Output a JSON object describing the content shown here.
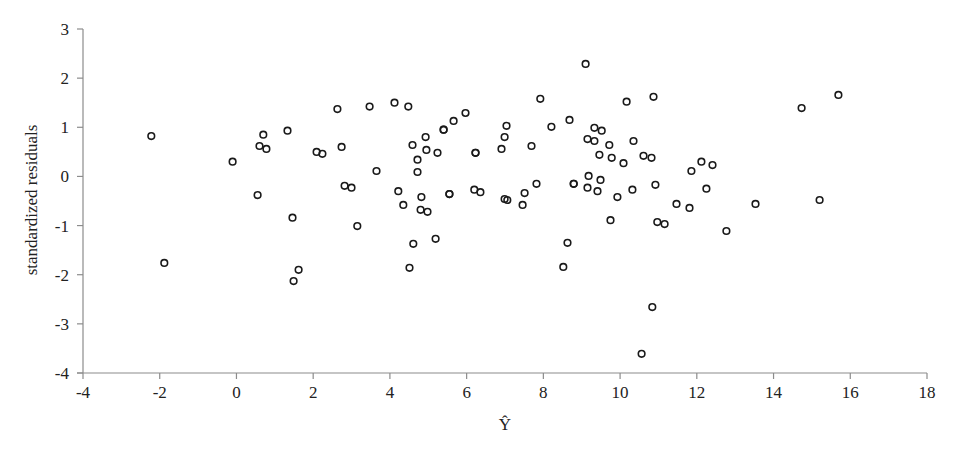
{
  "chart_data": {
    "type": "scatter",
    "title": "",
    "xlabel": "Ŷ",
    "ylabel": "standardized residuals",
    "xlim": [
      -4,
      18
    ],
    "ylim": [
      -4,
      3
    ],
    "xticks": [
      -4,
      -2,
      0,
      2,
      4,
      6,
      8,
      10,
      12,
      14,
      16,
      18
    ],
    "yticks": [
      -4,
      -3,
      -2,
      -1,
      0,
      1,
      2,
      3
    ],
    "grid": false,
    "legend": null,
    "marker": "open-circle",
    "colors": {
      "marker": "#1a1a1a",
      "axis": "#8c8c8c",
      "text": "#222222"
    },
    "series": [
      {
        "name": "residuals",
        "points": [
          [
            -2.22,
            0.82
          ],
          [
            -1.88,
            -1.76
          ],
          [
            -0.1,
            0.3
          ],
          [
            0.7,
            0.85
          ],
          [
            0.6,
            0.62
          ],
          [
            0.78,
            0.56
          ],
          [
            1.33,
            0.93
          ],
          [
            0.55,
            -0.38
          ],
          [
            1.46,
            -0.84
          ],
          [
            1.62,
            -1.9
          ],
          [
            1.49,
            -2.13
          ],
          [
            2.09,
            0.5
          ],
          [
            2.24,
            0.46
          ],
          [
            2.63,
            1.37
          ],
          [
            2.74,
            0.6
          ],
          [
            2.82,
            -0.19
          ],
          [
            3.0,
            -0.23
          ],
          [
            3.15,
            -1.01
          ],
          [
            3.47,
            1.42
          ],
          [
            3.65,
            0.11
          ],
          [
            4.12,
            1.5
          ],
          [
            4.48,
            1.42
          ],
          [
            4.22,
            -0.3
          ],
          [
            4.35,
            -0.58
          ],
          [
            4.61,
            -1.37
          ],
          [
            4.51,
            -1.86
          ],
          [
            4.59,
            0.64
          ],
          [
            4.93,
            0.8
          ],
          [
            4.95,
            0.54
          ],
          [
            4.72,
            0.34
          ],
          [
            4.72,
            0.09
          ],
          [
            4.82,
            -0.42
          ],
          [
            4.8,
            -0.68
          ],
          [
            4.98,
            -0.72
          ],
          [
            5.19,
            -1.27
          ],
          [
            5.24,
            0.48
          ],
          [
            5.4,
            0.95
          ],
          [
            5.4,
            0.95
          ],
          [
            5.55,
            -0.36
          ],
          [
            5.55,
            -0.36
          ],
          [
            5.66,
            1.13
          ],
          [
            5.97,
            1.29
          ],
          [
            6.23,
            0.48
          ],
          [
            6.23,
            0.48
          ],
          [
            6.2,
            -0.27
          ],
          [
            6.36,
            -0.32
          ],
          [
            7.04,
            1.03
          ],
          [
            6.99,
            0.8
          ],
          [
            6.91,
            0.56
          ],
          [
            6.99,
            -0.46
          ],
          [
            7.06,
            -0.48
          ],
          [
            7.51,
            -0.34
          ],
          [
            7.46,
            -0.58
          ],
          [
            7.69,
            0.62
          ],
          [
            7.82,
            -0.15
          ],
          [
            7.92,
            1.58
          ],
          [
            8.21,
            1.01
          ],
          [
            8.68,
            1.15
          ],
          [
            8.79,
            -0.15
          ],
          [
            8.79,
            -0.15
          ],
          [
            8.63,
            -1.35
          ],
          [
            8.52,
            -1.84
          ],
          [
            9.1,
            2.29
          ],
          [
            9.15,
            0.76
          ],
          [
            9.33,
            0.99
          ],
          [
            9.52,
            0.93
          ],
          [
            9.33,
            0.72
          ],
          [
            9.72,
            0.64
          ],
          [
            9.46,
            0.44
          ],
          [
            9.78,
            0.38
          ],
          [
            9.18,
            0.01
          ],
          [
            9.49,
            -0.07
          ],
          [
            9.15,
            -0.23
          ],
          [
            9.41,
            -0.3
          ],
          [
            9.93,
            -0.42
          ],
          [
            9.75,
            -0.89
          ],
          [
            10.09,
            0.27
          ],
          [
            10.17,
            1.52
          ],
          [
            10.35,
            0.72
          ],
          [
            10.32,
            -0.27
          ],
          [
            10.61,
            0.42
          ],
          [
            10.82,
            0.38
          ],
          [
            10.87,
            1.62
          ],
          [
            10.92,
            -0.17
          ],
          [
            10.97,
            -0.93
          ],
          [
            11.16,
            -0.97
          ],
          [
            10.84,
            -2.66
          ],
          [
            10.56,
            -3.61
          ],
          [
            11.47,
            -0.56
          ],
          [
            11.81,
            -0.64
          ],
          [
            11.86,
            0.11
          ],
          [
            12.12,
            0.3
          ],
          [
            12.41,
            0.23
          ],
          [
            12.25,
            -0.25
          ],
          [
            12.77,
            -1.11
          ],
          [
            13.53,
            -0.56
          ],
          [
            14.73,
            1.39
          ],
          [
            15.69,
            1.66
          ],
          [
            15.2,
            -0.48
          ]
        ]
      }
    ]
  }
}
